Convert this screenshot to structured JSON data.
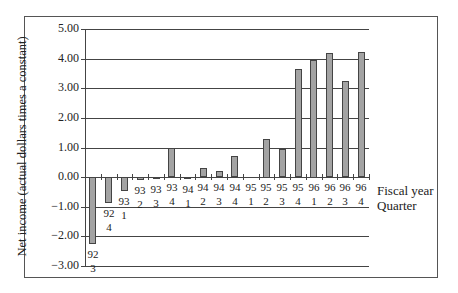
{
  "chart_data": {
    "type": "bar",
    "title": "",
    "xlabel": "Fiscal year Quarter",
    "xlabel_lines": [
      "Fiscal year",
      "Quarter"
    ],
    "ylabel": "Net income (actual dollars times a constant)",
    "ylim": [
      -3.0,
      5.0
    ],
    "yticks": [
      "5.00",
      "4.00",
      "3.00",
      "2.00",
      "1.00",
      "0.00",
      "-1.00",
      "-2.00",
      "-3.00"
    ],
    "grid": true,
    "legend": null,
    "categories": [
      {
        "year": "92",
        "quarter": "3"
      },
      {
        "year": "92",
        "quarter": "4"
      },
      {
        "year": "93",
        "quarter": "1"
      },
      {
        "year": "93",
        "quarter": "2"
      },
      {
        "year": "93",
        "quarter": "3"
      },
      {
        "year": "93",
        "quarter": "4"
      },
      {
        "year": "94",
        "quarter": "1"
      },
      {
        "year": "94",
        "quarter": "2"
      },
      {
        "year": "94",
        "quarter": "3"
      },
      {
        "year": "94",
        "quarter": "4"
      },
      {
        "year": "95",
        "quarter": "1"
      },
      {
        "year": "95",
        "quarter": "2"
      },
      {
        "year": "95",
        "quarter": "3"
      },
      {
        "year": "95",
        "quarter": "4"
      },
      {
        "year": "96",
        "quarter": "1"
      },
      {
        "year": "96",
        "quarter": "2"
      },
      {
        "year": "96",
        "quarter": "3"
      },
      {
        "year": "96",
        "quarter": "4"
      }
    ],
    "values": [
      -2.25,
      -0.88,
      -0.48,
      -0.1,
      -0.07,
      0.97,
      -0.07,
      0.3,
      0.2,
      0.7,
      0.0,
      1.3,
      0.95,
      3.65,
      3.97,
      4.2,
      3.25,
      4.22
    ],
    "colors": {
      "bar_fill": "#a3a3a3",
      "bar_edge": "#444444",
      "grid": "#444444"
    }
  }
}
